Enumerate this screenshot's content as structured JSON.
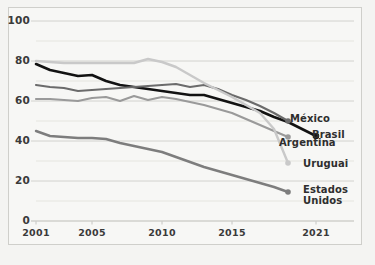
{
  "chart_data": {
    "type": "line",
    "title": "",
    "subtitle": "",
    "xlabel": "",
    "ylabel": "",
    "xlim": [
      2001,
      2021
    ],
    "ylim": [
      0,
      100
    ],
    "grid": true,
    "grid_major_step": 20,
    "grid_minor_step": 10,
    "legend_position": "right-inline-end-of-line",
    "xticks": [
      "2001",
      "2005",
      "2010",
      "2015",
      "2021"
    ],
    "xtick_values": [
      2001,
      2005,
      2010,
      2015,
      2021
    ],
    "yticks": [
      "0",
      "20",
      "40",
      "60",
      "80",
      "100"
    ],
    "ytick_values": [
      0,
      20,
      40,
      60,
      80,
      100
    ],
    "x": [
      2001,
      2002,
      2003,
      2004,
      2005,
      2006,
      2007,
      2008,
      2009,
      2010,
      2011,
      2012,
      2013,
      2014,
      2015,
      2016,
      2017,
      2018,
      2019,
      2020,
      2021
    ],
    "series": [
      {
        "name": "Brasil",
        "color": "#121212",
        "width": 2.6,
        "end_marker": true,
        "label": "Brasil",
        "values": [
          78.5,
          75.5,
          74.0,
          72.5,
          73.0,
          70.0,
          68.0,
          67.0,
          66.0,
          65.0,
          64.0,
          63.0,
          63.0,
          61.0,
          59.0,
          57.0,
          55.0,
          52.0,
          49.5,
          46.0,
          42.5
        ]
      },
      {
        "name": "México",
        "color": "#6b6b6b",
        "width": 2.2,
        "end_marker": true,
        "label": "México",
        "values": [
          68.0,
          67.0,
          66.5,
          65.0,
          65.5,
          66.0,
          66.5,
          67.0,
          67.5,
          68.0,
          68.5,
          67.0,
          68.0,
          66.0,
          63.0,
          60.5,
          57.5,
          54.0,
          50.0,
          null,
          null
        ]
      },
      {
        "name": "Argentina",
        "color": "#9a9a9a",
        "width": 2.2,
        "end_marker": true,
        "label": "Argentina",
        "values": [
          61.0,
          61.0,
          60.5,
          60.0,
          61.5,
          62.0,
          60.0,
          62.5,
          60.5,
          62.0,
          61.0,
          59.5,
          58.0,
          56.0,
          54.0,
          51.0,
          48.0,
          45.0,
          42.0,
          null,
          null
        ]
      },
      {
        "name": "Uruguai",
        "color": "#c9c9c9",
        "width": 2.4,
        "end_marker": true,
        "label": "Uruguai",
        "values": [
          80.0,
          79.5,
          79.0,
          79.0,
          79.0,
          79.0,
          79.0,
          79.0,
          81.0,
          79.5,
          77.0,
          73.0,
          69.0,
          65.5,
          62.0,
          58.0,
          54.0,
          46.0,
          29.0,
          null,
          null
        ]
      },
      {
        "name": "Estados Unidos",
        "color": "#7d7d7d",
        "width": 2.4,
        "end_marker": true,
        "label": "Estados\nUnidos",
        "values": [
          45.0,
          42.5,
          42.0,
          41.5,
          41.5,
          41.0,
          39.0,
          37.5,
          36.0,
          34.5,
          32.0,
          29.5,
          27.0,
          25.0,
          23.0,
          21.0,
          19.0,
          17.0,
          14.5,
          null,
          null
        ]
      }
    ],
    "annotations": [
      {
        "text": "México",
        "x": 2019,
        "y": 50
      },
      {
        "text": "Brasil",
        "x": 2021,
        "y": 42.5
      },
      {
        "text": "Argentina",
        "x": 2019,
        "y": 42
      },
      {
        "text": "Uruguai",
        "x": 2019,
        "y": 29
      },
      {
        "text": "Estados Unidos",
        "x": 2019,
        "y": 14.5
      }
    ],
    "colors": {
      "brasil": "#121212",
      "mexico": "#6b6b6b",
      "argentina": "#9a9a9a",
      "uruguai": "#c9c9c9",
      "estados_unidos": "#7d7d7d",
      "grid": "#dcdcd8",
      "frame": "#cfcfcb",
      "axis_text": "#3a3a3a",
      "background": "#f7f7f5"
    }
  },
  "labels": {
    "mexico": "México",
    "brasil": "Brasil",
    "argentina": "Argentina",
    "uruguai": "Uruguai",
    "estados_unidos_line1": "Estados",
    "estados_unidos_line2": "Unidos"
  }
}
